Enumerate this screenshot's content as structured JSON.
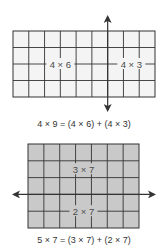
{
  "diagrams": [
    {
      "id": "top",
      "rows": 4,
      "cols": 9,
      "split_after_col": 6,
      "split_orientation": "vertical",
      "fill": "#f4f4f4",
      "line": "#333333",
      "parts": [
        {
          "label": "4 × 6"
        },
        {
          "label": "4 × 3"
        }
      ],
      "caption": "4 × 9 = (4 × 6) + (4 × 3)"
    },
    {
      "id": "bottom",
      "rows": 5,
      "cols": 7,
      "split_after_row": 3,
      "split_orientation": "horizontal",
      "fill": "#c9c9c9",
      "line": "#333333",
      "parts": [
        {
          "label": "3 × 7"
        },
        {
          "label": "2 × 7"
        }
      ],
      "caption": "5 × 7 = (3 × 7) + (2 × 7)"
    }
  ]
}
